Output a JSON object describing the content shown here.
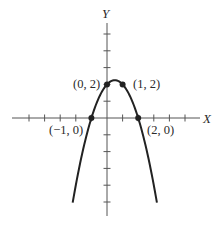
{
  "chart_data": {
    "type": "line",
    "title": "",
    "xlabel": "X",
    "ylabel": "Y",
    "function": "y = -x^2 + x + 2",
    "xlim": [
      -6,
      6
    ],
    "ylim": [
      -6,
      6
    ],
    "grid": false,
    "x_ticks": [
      -5,
      -4,
      -3,
      -2,
      -1,
      0,
      1,
      2,
      3,
      4,
      5
    ],
    "y_ticks": [
      -5,
      -4,
      -3,
      -2,
      -1,
      0,
      1,
      2,
      3,
      4,
      5
    ],
    "series": [
      {
        "name": "parabola",
        "color": "#222222",
        "x": [
          -2.2,
          -1.5,
          -1,
          -0.5,
          0,
          0.5,
          1,
          1.5,
          2,
          2.5,
          3.2
        ],
        "values": [
          -5.04,
          -1.75,
          0,
          1.25,
          2,
          2.25,
          2,
          1.25,
          0,
          -1.75,
          -5.04
        ]
      }
    ],
    "marked_points": [
      {
        "x": 0,
        "y": 2,
        "label": "(0, 2)"
      },
      {
        "x": 1,
        "y": 2,
        "label": "(1, 2)"
      },
      {
        "x": -1,
        "y": 0,
        "label": "(−1, 0)"
      },
      {
        "x": 2,
        "y": 0,
        "label": "(2, 0)"
      }
    ]
  },
  "labels": {
    "x_axis": "X",
    "y_axis": "Y",
    "p02": "(0, 2)",
    "p12": "(1, 2)",
    "pm10": "(−1, 0)",
    "p20": "(2, 0)"
  },
  "colors": {
    "ink": "#222222",
    "axis": "#555555",
    "background": "#ffffff"
  }
}
